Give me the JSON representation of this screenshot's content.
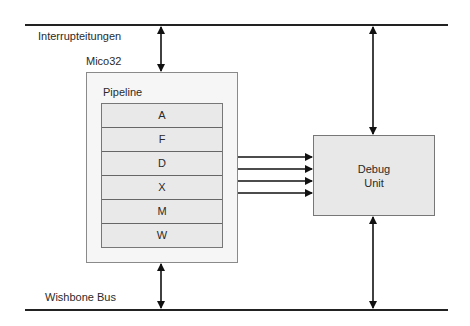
{
  "diagram": {
    "top_bus_label": "Interrupteitungen",
    "bottom_bus_label": "Wishbone Bus",
    "cpu": {
      "label": "Mico32",
      "pipeline": {
        "label": "Pipeline",
        "stages": [
          "A",
          "F",
          "D",
          "X",
          "M",
          "W"
        ]
      }
    },
    "debug_unit": {
      "line1": "Debug",
      "line2": "Unit"
    },
    "connections": [
      {
        "from": "interrupt-lines",
        "to": "mico32",
        "type": "bidirectional"
      },
      {
        "from": "interrupt-lines",
        "to": "debug-unit",
        "type": "bidirectional"
      },
      {
        "from": "mico32",
        "to": "wishbone-bus",
        "type": "bidirectional"
      },
      {
        "from": "debug-unit",
        "to": "wishbone-bus",
        "type": "bidirectional"
      },
      {
        "from": "pipeline-D-X",
        "to": "debug-unit",
        "type": "unidirectional",
        "count": 4
      }
    ]
  }
}
